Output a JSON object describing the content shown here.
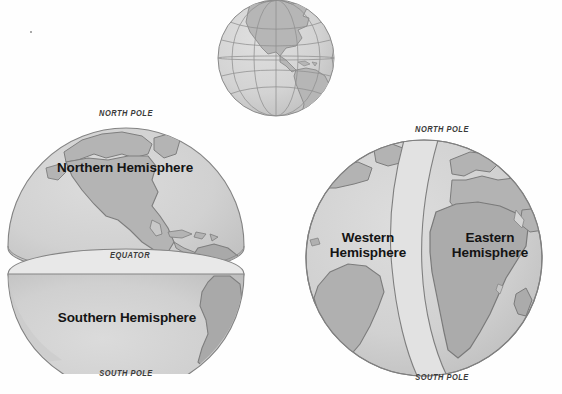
{
  "figure": {
    "background_color": "#fefefe",
    "ocean_color": "#d2d2d2",
    "land_color": "#b4b4b4",
    "outline_color": "#7a7a7a",
    "cut_face_color": "#e4e4e4",
    "meridian_band_color": "#dcdcdc",
    "label_color": "#141414",
    "pole_label_color": "#3a3a3a"
  },
  "globes": {
    "top": {
      "name": "reference-globe",
      "description": "Small reference globe with latitude and longitude grid lines showing the Americas",
      "grid": "on",
      "labels": []
    },
    "left": {
      "name": "northern-southern-globe",
      "description": "Globe split at the equator into two separated hemispheres",
      "hemispheres": [
        {
          "id": "northern",
          "label": "Northern Hemisphere"
        },
        {
          "id": "southern",
          "label": "Southern Hemisphere"
        }
      ],
      "markers": [
        {
          "id": "north-pole",
          "label": "NORTH POLE"
        },
        {
          "id": "equator",
          "label": "EQUATOR"
        },
        {
          "id": "south-pole",
          "label": "SOUTH POLE"
        }
      ]
    },
    "right": {
      "name": "western-eastern-globe",
      "description": "Globe divided along the prime meridian into western and eastern hemispheres",
      "hemispheres": [
        {
          "id": "western",
          "label": "Western\nHemisphere"
        },
        {
          "id": "eastern",
          "label": "Eastern\nHemisphere"
        }
      ],
      "markers": [
        {
          "id": "north-pole",
          "label": "NORTH POLE"
        },
        {
          "id": "south-pole",
          "label": "SOUTH POLE"
        }
      ]
    }
  }
}
